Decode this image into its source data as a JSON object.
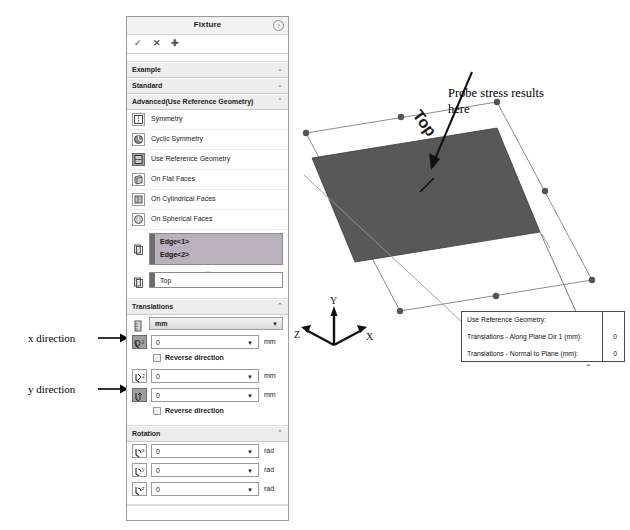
{
  "panel": {
    "title": "Fixture",
    "help_icon": "question-icon",
    "actions": [
      {
        "name": "accept",
        "glyph": "✓"
      },
      {
        "name": "cancel",
        "glyph": "✕"
      },
      {
        "name": "pin",
        "glyph": "➕"
      }
    ],
    "sections": [
      {
        "label": "Example",
        "chevron": "⌄",
        "expanded": false
      },
      {
        "label": "Standard",
        "chevron": "⌄",
        "expanded": false
      },
      {
        "label": "Advanced(Use Reference Geometry)",
        "chevron": "⌃",
        "expanded": true
      }
    ],
    "advanced_options": [
      {
        "label": "Symmetry",
        "icon": "symmetry-icon",
        "selected": false
      },
      {
        "label": "Cyclic Symmetry",
        "icon": "cyclic-symmetry-icon",
        "selected": false
      },
      {
        "label": "Use Reference Geometry",
        "icon": "reference-geometry-icon",
        "selected": true
      },
      {
        "label": "On Flat Faces",
        "icon": "flat-faces-icon",
        "selected": false
      },
      {
        "label": "On Cylindrical Faces",
        "icon": "cylindrical-faces-icon",
        "selected": false
      },
      {
        "label": "On Spherical Faces",
        "icon": "spherical-faces-icon",
        "selected": false
      }
    ],
    "selection_box": {
      "icon": "edge-selection-icon",
      "items": [
        "Edge<1>",
        "Edge<2>"
      ]
    },
    "plane_box": {
      "icon": "plane-reference-icon",
      "value": "Top"
    },
    "translations": {
      "header": "Translations",
      "chevron": "⌃",
      "unit_icon": "units-icon",
      "unit_value": "mm",
      "rows": [
        {
          "icon": "along-plane-dir1-icon",
          "value": "0",
          "unit": "mm",
          "active": true,
          "checkbox": {
            "label": "Reverse direction",
            "checked": false
          }
        },
        {
          "icon": "along-plane-dir2-icon",
          "value": "0",
          "unit": "mm",
          "active": false,
          "checkbox": null
        },
        {
          "icon": "normal-to-plane-icon",
          "value": "0",
          "unit": "mm",
          "active": true,
          "checkbox": {
            "label": "Reverse direction",
            "checked": false
          }
        }
      ]
    },
    "rotation": {
      "header": "Rotation",
      "chevron": "⌃",
      "rows": [
        {
          "icon": "rotation-x-icon",
          "value": "0",
          "unit": "rad"
        },
        {
          "icon": "rotation-y-icon",
          "value": "0",
          "unit": "rad"
        },
        {
          "icon": "rotation-z-icon",
          "value": "0",
          "unit": "rad"
        }
      ]
    }
  },
  "side_notes": {
    "x_direction": "x direction",
    "y_direction": "y direction"
  },
  "viewport": {
    "plane_label": "Top",
    "triad": {
      "x": "X",
      "y": "Y",
      "z": "Z"
    },
    "probe_note": "Probe stress results here"
  },
  "result_callout": {
    "title": "Use Reference Geometry:",
    "rows": [
      {
        "label": "Translations - Along Plane Dir 1 (mm):",
        "value": "0"
      },
      {
        "label": "Translations - Normal to Plane (mm):",
        "value": "0"
      }
    ],
    "chevron": "⌃"
  },
  "colors": {
    "selection_highlight": "#b9b1bd",
    "section_header_bg": "#ededed",
    "body_fill": "#585858",
    "panel_border": "#9a9a9a"
  }
}
